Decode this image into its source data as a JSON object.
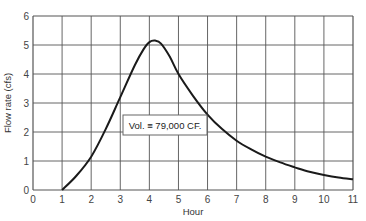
{
  "chart_data": {
    "type": "line",
    "title": "",
    "xlabel": "Hour",
    "ylabel": "Flow rate (cfs)",
    "xlim": [
      0,
      11
    ],
    "ylim": [
      0,
      6
    ],
    "grid": true,
    "legend": null,
    "x_ticks": [
      "0",
      "1",
      "2",
      "3",
      "4",
      "5",
      "6",
      "7",
      "8",
      "9",
      "10",
      "11"
    ],
    "y_ticks": [
      "0",
      "1",
      "2",
      "3",
      "4",
      "5",
      "6"
    ],
    "series": [
      {
        "name": "Hydrograph",
        "x": [
          1.0,
          1.5,
          2.0,
          2.5,
          3.0,
          3.5,
          3.8,
          4.0,
          4.2,
          4.4,
          4.7,
          5.0,
          5.5,
          6.0,
          6.5,
          7.0,
          7.5,
          8.0,
          8.5,
          9.0,
          9.5,
          10.0,
          10.5,
          11.0
        ],
        "y": [
          0.0,
          0.5,
          1.15,
          2.1,
          3.2,
          4.3,
          4.85,
          5.1,
          5.15,
          5.05,
          4.6,
          4.0,
          3.25,
          2.6,
          2.1,
          1.7,
          1.4,
          1.15,
          0.95,
          0.78,
          0.63,
          0.52,
          0.43,
          0.37
        ]
      }
    ],
    "annotations": [
      {
        "text": "Vol. ≡ 79,000 CF.",
        "x": 4.2,
        "y": 2.1
      }
    ],
    "line_color": "#1a1a1a",
    "grid_color": "#555555"
  },
  "annotation": {
    "text": "Vol. ≡ 79,000 CF."
  },
  "axes": {
    "xlabel": "Hour",
    "ylabel": "Flow rate (cfs)"
  }
}
